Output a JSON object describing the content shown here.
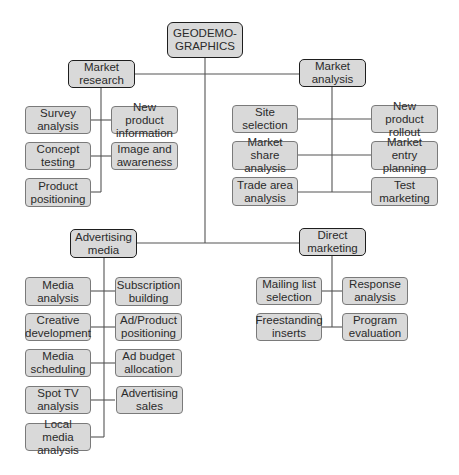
{
  "diagram": {
    "root": {
      "label": "GEODEMO-\nGRAPHICS"
    },
    "colors": {
      "box_fill": "#d9d9d9",
      "child_border": "#7a7a7a",
      "parent_border": "#1e1e1e",
      "line": "#555555"
    },
    "branches": [
      {
        "label": "Market\nresearch",
        "children": [
          {
            "label": "Survey\nanalysis"
          },
          {
            "label": "New product\ninformation"
          },
          {
            "label": "Concept\ntesting"
          },
          {
            "label": "Image and\nawareness"
          },
          {
            "label": "Product\npositioning"
          }
        ]
      },
      {
        "label": "Market\nanalysis",
        "children": [
          {
            "label": "Site selection"
          },
          {
            "label": "New product\nrollout"
          },
          {
            "label": "Market share\nanalysis"
          },
          {
            "label": "Market entry\nplanning"
          },
          {
            "label": "Trade area\nanalysis"
          },
          {
            "label": "Test\nmarketing"
          }
        ]
      },
      {
        "label": "Advertising\nmedia",
        "children": [
          {
            "label": "Media\nanalysis"
          },
          {
            "label": "Subscription\nbuilding"
          },
          {
            "label": "Creative\ndevelopment"
          },
          {
            "label": "Ad/Product\npositioning"
          },
          {
            "label": "Media\nscheduling"
          },
          {
            "label": "Ad budget\nallocation"
          },
          {
            "label": "Spot TV\nanalysis"
          },
          {
            "label": "Advertising\nsales"
          },
          {
            "label": "Local media\nanalysis"
          }
        ]
      },
      {
        "label": "Direct\nmarketing",
        "children": [
          {
            "label": "Mailing list\nselection"
          },
          {
            "label": "Response\nanalysis"
          },
          {
            "label": "Freestanding\ninserts"
          },
          {
            "label": "Program\nevaluation"
          }
        ]
      }
    ]
  }
}
